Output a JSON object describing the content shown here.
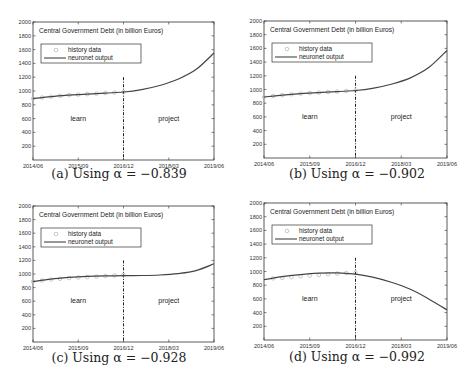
{
  "figure": {
    "panels": [
      {
        "id": "a",
        "caption": "(a) Using α = −0.839"
      },
      {
        "id": "b",
        "caption": "(b) Using α = −0.902"
      },
      {
        "id": "c",
        "caption": "(c) Using α = −0.928"
      },
      {
        "id": "d",
        "caption": "(d) Using α = −0.992"
      }
    ]
  },
  "chart_data": [
    {
      "type": "line",
      "title": "Central Government Debt (in billion Euros)",
      "caption": "(a) Using α = −0.839",
      "xlabel": "",
      "ylabel": "",
      "x_ticks": [
        "2014/06",
        "2015/09",
        "2016/12",
        "2018/03",
        "2019/06"
      ],
      "y_ticks": [
        200,
        400,
        600,
        800,
        1000,
        1200,
        1400,
        1600,
        1800,
        2000
      ],
      "ylim": [
        0,
        2000
      ],
      "legend": [
        "history data",
        "neuronet output"
      ],
      "legend_position": "upper left",
      "annotations": [
        "learn",
        "project"
      ],
      "split_at": "2016/12",
      "series": [
        {
          "name": "history data",
          "x": [
            0,
            1,
            2,
            3,
            4,
            5,
            6,
            7,
            8,
            9,
            10
          ],
          "values": [
            890,
            905,
            918,
            930,
            940,
            948,
            955,
            962,
            970,
            978,
            985
          ]
        },
        {
          "name": "neuronet output",
          "x": [
            0,
            2,
            4,
            6,
            8,
            10,
            12,
            14,
            16,
            18,
            20
          ],
          "values": [
            890,
            918,
            940,
            955,
            970,
            985,
            1020,
            1080,
            1170,
            1310,
            1550
          ]
        }
      ]
    },
    {
      "type": "line",
      "title": "Central Government Debt (in billion Euros)",
      "caption": "(b) Using α = −0.902",
      "xlabel": "",
      "ylabel": "",
      "x_ticks": [
        "2014/06",
        "2015/09",
        "2016/12",
        "2018/03",
        "2019/06"
      ],
      "y_ticks": [
        200,
        400,
        600,
        800,
        1000,
        1200,
        1400,
        1600,
        1800,
        2000
      ],
      "ylim": [
        0,
        2000
      ],
      "legend": [
        "history data",
        "neuronet output"
      ],
      "legend_position": "upper left",
      "annotations": [
        "learn",
        "project"
      ],
      "split_at": "2016/12",
      "series": [
        {
          "name": "history data",
          "x": [
            0,
            1,
            2,
            3,
            4,
            5,
            6,
            7,
            8,
            9,
            10
          ],
          "values": [
            890,
            905,
            918,
            930,
            940,
            948,
            955,
            962,
            970,
            978,
            985
          ]
        },
        {
          "name": "neuronet output",
          "x": [
            0,
            2,
            4,
            6,
            8,
            10,
            12,
            14,
            16,
            18,
            20
          ],
          "values": [
            890,
            918,
            940,
            955,
            970,
            985,
            1020,
            1080,
            1170,
            1320,
            1570
          ]
        }
      ]
    },
    {
      "type": "line",
      "title": "Central Government Debt (in billion Euros)",
      "caption": "(c) Using α = −0.928",
      "xlabel": "",
      "ylabel": "",
      "x_ticks": [
        "2014/06",
        "2015/09",
        "2016/12",
        "2018/03",
        "2019/06"
      ],
      "y_ticks": [
        200,
        400,
        600,
        800,
        1000,
        1200,
        1400,
        1600,
        1800,
        2000
      ],
      "ylim": [
        0,
        2000
      ],
      "legend": [
        "history data",
        "neuronet output"
      ],
      "legend_position": "upper left",
      "annotations": [
        "learn",
        "project"
      ],
      "split_at": "2016/12",
      "series": [
        {
          "name": "history data",
          "x": [
            0,
            1,
            2,
            3,
            4,
            5,
            6,
            7,
            8,
            9,
            10
          ],
          "values": [
            890,
            905,
            918,
            930,
            940,
            948,
            955,
            962,
            970,
            978,
            985
          ]
        },
        {
          "name": "neuronet output",
          "x": [
            0,
            2,
            4,
            6,
            8,
            10,
            12,
            14,
            16,
            18,
            20
          ],
          "values": [
            890,
            925,
            950,
            965,
            972,
            975,
            978,
            985,
            1005,
            1050,
            1150
          ]
        }
      ]
    },
    {
      "type": "line",
      "title": "Central Government Debt (in billion Euros)",
      "caption": "(d) Using α = −0.992",
      "xlabel": "",
      "ylabel": "",
      "x_ticks": [
        "2014/06",
        "2015/09",
        "2016/12",
        "2018/03",
        "2019/06"
      ],
      "y_ticks": [
        200,
        400,
        600,
        800,
        1000,
        1200,
        1400,
        1600,
        1800,
        2000
      ],
      "ylim": [
        0,
        2000
      ],
      "legend": [
        "history data",
        "neuronet output"
      ],
      "legend_position": "upper left",
      "annotations": [
        "learn",
        "project"
      ],
      "split_at": "2016/12",
      "series": [
        {
          "name": "history data",
          "x": [
            1,
            2,
            3,
            4,
            5,
            6,
            7,
            8,
            9,
            10
          ],
          "values": [
            900,
            905,
            918,
            930,
            940,
            948,
            962,
            970,
            978,
            985
          ]
        },
        {
          "name": "neuronet output",
          "x": [
            0,
            2,
            4,
            6,
            8,
            10,
            12,
            14,
            16,
            18,
            20
          ],
          "values": [
            880,
            925,
            955,
            975,
            980,
            960,
            915,
            840,
            740,
            600,
            440
          ]
        }
      ]
    }
  ]
}
